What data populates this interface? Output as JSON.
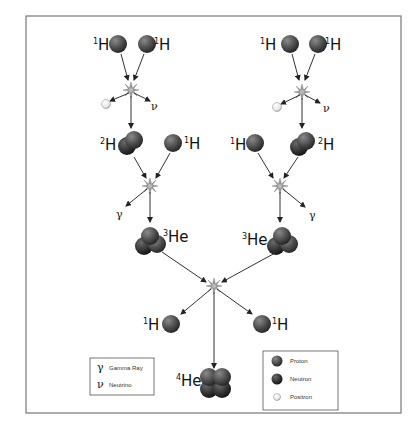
{
  "diagram": {
    "stage1_left": {
      "reactant_a": "1H",
      "reactant_b": "1H",
      "products": [
        "positron",
        "ν"
      ],
      "product_symbol": "ν"
    },
    "stage1_right": {
      "reactant_a": "1H",
      "reactant_b": "1H",
      "products": [
        "positron",
        "ν"
      ],
      "product_symbol": "ν"
    },
    "stage2_left": {
      "reactant_a": "2H",
      "reactant_b": "1H",
      "emitted": "γ",
      "product": "3He"
    },
    "stage2_right": {
      "reactant_a": "1H",
      "reactant_b": "2H",
      "emitted": "γ",
      "product": "3He"
    },
    "stage3": {
      "reactant_a": "3He",
      "reactant_b": "3He",
      "released": [
        "1H",
        "1H"
      ],
      "product": "4He"
    },
    "labels": {
      "h": "H",
      "he": "He",
      "mass1": "1",
      "mass2": "2",
      "mass3": "3",
      "mass4": "4",
      "gamma": "γ",
      "nu": "ν"
    }
  },
  "legend_symbols": {
    "items": [
      {
        "symbol": "γ",
        "label": "Gamma Ray"
      },
      {
        "symbol": "ν",
        "label": "Neutrino"
      }
    ]
  },
  "legend_particles": {
    "items": [
      {
        "icon": "proton-sphere",
        "label": "Proton"
      },
      {
        "icon": "neutron-sphere",
        "label": "Neutron"
      },
      {
        "icon": "positron-sphere",
        "label": "Positron"
      }
    ]
  },
  "colors": {
    "proton": "#555555",
    "neutron": "#3a3a3a",
    "positron": "#f4f4f4",
    "frame": "#777777",
    "arrow": "#333333"
  }
}
